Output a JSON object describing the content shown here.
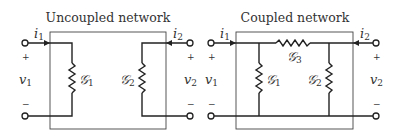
{
  "diagrams": [
    {
      "title": "Uncoupled network",
      "current_left": {
        "sym": "i",
        "sub": "1"
      },
      "current_right": {
        "sym": "i",
        "sub": "2"
      },
      "voltage_left": {
        "sym": "v",
        "sub": "1"
      },
      "voltage_right": {
        "sym": "v",
        "sub": "2"
      },
      "plus": "+",
      "minus": "−",
      "elements": [
        {
          "sym": "𝒢",
          "sub": "1"
        },
        {
          "sym": "𝒢",
          "sub": "2"
        }
      ]
    },
    {
      "title": "Coupled network",
      "current_left": {
        "sym": "i",
        "sub": "1"
      },
      "current_right": {
        "sym": "i",
        "sub": "2"
      },
      "voltage_left": {
        "sym": "v",
        "sub": "1"
      },
      "voltage_right": {
        "sym": "v",
        "sub": "2"
      },
      "plus": "+",
      "minus": "−",
      "elements": [
        {
          "sym": "𝒢",
          "sub": "1"
        },
        {
          "sym": "𝒢",
          "sub": "2"
        },
        {
          "sym": "𝒢",
          "sub": "3"
        }
      ]
    }
  ],
  "colors": {
    "line": "#222222",
    "box": "#444444",
    "text": "#333333"
  }
}
